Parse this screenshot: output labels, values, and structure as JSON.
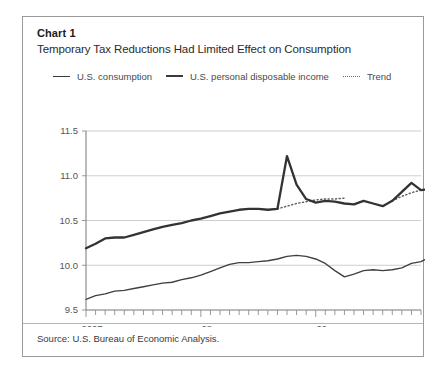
{
  "chart_label": "Chart 1",
  "title": "Temporary Tax Reductions Had Limited Effect on Consumption",
  "legend": [
    {
      "label": "U.S. consumption",
      "style": "thin-line",
      "color": "#3f3f3f"
    },
    {
      "label": "U.S. personal disposable income",
      "style": "thick-line",
      "color": "#333333"
    },
    {
      "label": "Trend",
      "style": "dotted-line",
      "color": "#6a6a6a"
    }
  ],
  "source": "Source: U.S. Bureau of Economic Analysis.",
  "chart_data": {
    "type": "line",
    "title": "Temporary Tax Reductions Had Limited Effect on Consumption",
    "xlabel": "",
    "ylabel": "",
    "ylim": [
      9.5,
      11.5
    ],
    "yticks": [
      9.5,
      10.0,
      10.5,
      11.0,
      11.5
    ],
    "ytick_labels": [
      "9.5",
      "10.0",
      "10.5",
      "11.0",
      "11.5"
    ],
    "grid": true,
    "legend_position": "top",
    "x_axis_note": "monthly ticks, year labels at 2007, 08, 09",
    "xtick_labels": [
      "2007",
      "08",
      "09"
    ],
    "xtick_positions": [
      0,
      12,
      24
    ],
    "x_count": 36,
    "series": [
      {
        "name": "U.S. personal disposable income",
        "style": "thick-line",
        "values": [
          10.19,
          10.24,
          10.3,
          10.31,
          10.31,
          10.34,
          10.37,
          10.4,
          10.43,
          10.45,
          10.47,
          10.5,
          10.52,
          10.55,
          10.58,
          10.6,
          10.62,
          10.63,
          10.63,
          10.62,
          10.63,
          11.22,
          10.9,
          10.74,
          10.7,
          10.72,
          10.71,
          10.69,
          10.68,
          10.72,
          10.69,
          10.66,
          10.72,
          10.82,
          10.92,
          10.84,
          10.85,
          10.86
        ]
      },
      {
        "name": "U.S. consumption",
        "style": "thin-line",
        "values": [
          9.62,
          9.66,
          9.68,
          9.71,
          9.72,
          9.74,
          9.76,
          9.78,
          9.8,
          9.81,
          9.84,
          9.86,
          9.89,
          9.93,
          9.97,
          10.01,
          10.03,
          10.03,
          10.04,
          10.05,
          10.07,
          10.1,
          10.11,
          10.1,
          10.07,
          10.02,
          9.94,
          9.87,
          9.9,
          9.94,
          9.95,
          9.94,
          9.95,
          9.97,
          10.02,
          10.04,
          10.1,
          10.15
        ]
      }
    ],
    "trend_segments": [
      {
        "name": "Trend",
        "style": "dotted-line",
        "x_start": 20,
        "x_end": 27,
        "values": [
          10.63,
          10.66,
          10.69,
          10.71,
          10.73,
          10.74,
          10.74,
          10.75
        ]
      },
      {
        "name": "Trend",
        "style": "dotted-line",
        "x_start": 32,
        "x_end": 35,
        "values": [
          10.72,
          10.77,
          10.81,
          10.84
        ]
      }
    ],
    "annotations": [
      {
        "text": "spike in disposable income mid-2008 (tax rebate)",
        "x": 21,
        "y": 11.22
      }
    ]
  }
}
